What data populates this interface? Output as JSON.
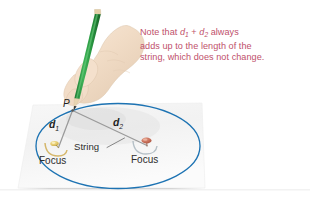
{
  "figure": {
    "note": {
      "line1_pre": "Note that ",
      "line1_var1": "d",
      "line1_sub1": "1",
      "line1_mid": " + ",
      "line1_var2": "d",
      "line1_sub2": "2",
      "line1_post": " always",
      "line2": "adds up to the length of the",
      "line3": "string, which does not change.",
      "color": "#c0506b"
    },
    "labels": {
      "point_p": "P",
      "d1_var": "d",
      "d1_sub": "1",
      "d2_var": "d",
      "d2_sub": "2",
      "string": "String",
      "focus_left": "Focus",
      "focus_right": "Focus"
    },
    "colors": {
      "ellipse": "#1d73b3",
      "paper": "#f4f4f4",
      "string": "#8d8d8d",
      "pencil_body": "#2e9c45",
      "pencil_wood": "#e6d2b0",
      "hand": "#f0ddc9",
      "pin_left": "#e8c96a",
      "pin_right": "#c86a57",
      "note_text": "#c0506b",
      "label_text": "#2d2d2d"
    },
    "geometry": {
      "ellipse_center_x": 118,
      "ellipse_center_y": 146,
      "ellipse_rx": 82,
      "ellipse_ry": 43,
      "point_p_x": 72,
      "point_p_y": 110,
      "focus_left_x": 57,
      "focus_left_y": 147,
      "focus_right_x": 146,
      "focus_right_y": 145
    }
  }
}
